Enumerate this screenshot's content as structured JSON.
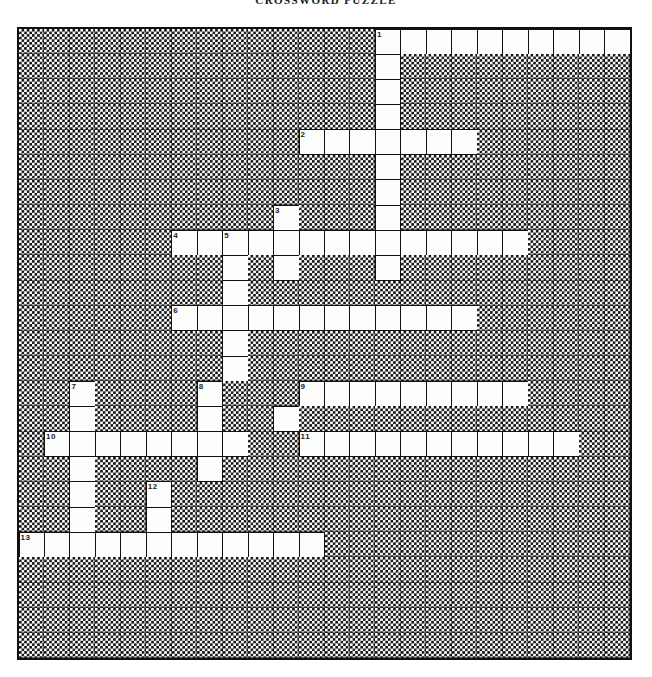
{
  "title": "CROSSWORD PUZZLE",
  "grid": {
    "columns": 24,
    "rows": 25,
    "cell_colors": {
      "open": "#fdfdfb",
      "block_fill": "#111111",
      "block_background": "#ffffff",
      "grid_line": "#111111"
    },
    "legend": {
      "open_symbol": ".",
      "block_symbol": "#"
    },
    "layout": [
      "###############..........",
      "###############.########",
      "###############.########",
      "###############.########",
      "############......######",
      "###############.########",
      "###############.########",
      "###########.###.########",
      "#######...............##",
      "########.##.###.########",
      "########.###############",
      "#######...........######",
      "########.###############",
      "########.###############",
      "###.####.###.........###",
      "###.####.##.#.##########",
      "#.........#.#...........",
      "###.####.###.###########",
      "###.##.#.###############",
      "###.##.#################",
      "............############",
      "########################",
      "########################",
      "########################",
      "########################"
    ],
    "rows_data": [
      {
        "row": 0,
        "open_runs": [
          {
            "start": 14,
            "len": 10
          }
        ]
      },
      {
        "row": 1,
        "open_runs": [
          {
            "start": 14,
            "len": 1
          }
        ]
      },
      {
        "row": 2,
        "open_runs": [
          {
            "start": 14,
            "len": 1
          }
        ]
      },
      {
        "row": 3,
        "open_runs": [
          {
            "start": 14,
            "len": 1
          }
        ]
      },
      {
        "row": 4,
        "open_runs": [
          {
            "start": 11,
            "len": 7
          }
        ]
      },
      {
        "row": 5,
        "open_runs": [
          {
            "start": 14,
            "len": 1
          }
        ]
      },
      {
        "row": 6,
        "open_runs": [
          {
            "start": 14,
            "len": 1
          }
        ]
      },
      {
        "row": 7,
        "open_runs": [
          {
            "start": 10,
            "len": 1
          },
          {
            "start": 14,
            "len": 1
          }
        ]
      },
      {
        "row": 8,
        "open_runs": [
          {
            "start": 6,
            "len": 14
          }
        ]
      },
      {
        "row": 9,
        "open_runs": [
          {
            "start": 8,
            "len": 1
          },
          {
            "start": 10,
            "len": 1
          },
          {
            "start": 14,
            "len": 1
          }
        ]
      },
      {
        "row": 10,
        "open_runs": [
          {
            "start": 8,
            "len": 1
          }
        ]
      },
      {
        "row": 11,
        "open_runs": [
          {
            "start": 6,
            "len": 12
          }
        ]
      },
      {
        "row": 12,
        "open_runs": [
          {
            "start": 8,
            "len": 1
          }
        ]
      },
      {
        "row": 13,
        "open_runs": [
          {
            "start": 8,
            "len": 1
          }
        ]
      },
      {
        "row": 14,
        "open_runs": [
          {
            "start": 2,
            "len": 1
          },
          {
            "start": 7,
            "len": 1
          },
          {
            "start": 11,
            "len": 9
          }
        ]
      },
      {
        "row": 15,
        "open_runs": [
          {
            "start": 2,
            "len": 1
          },
          {
            "start": 7,
            "len": 1
          },
          {
            "start": 10,
            "len": 1
          }
        ]
      },
      {
        "row": 16,
        "open_runs": [
          {
            "start": 1,
            "len": 8
          },
          {
            "start": 11,
            "len": 11
          }
        ]
      },
      {
        "row": 17,
        "open_runs": [
          {
            "start": 2,
            "len": 1
          },
          {
            "start": 7,
            "len": 1
          }
        ]
      },
      {
        "row": 18,
        "open_runs": [
          {
            "start": 2,
            "len": 1
          },
          {
            "start": 5,
            "len": 1
          }
        ]
      },
      {
        "row": 19,
        "open_runs": [
          {
            "start": 2,
            "len": 1
          },
          {
            "start": 5,
            "len": 1
          }
        ]
      },
      {
        "row": 20,
        "open_runs": [
          {
            "start": 0,
            "len": 12
          }
        ]
      },
      {
        "row": 21,
        "open_runs": []
      },
      {
        "row": 22,
        "open_runs": []
      },
      {
        "row": 23,
        "open_runs": []
      },
      {
        "row": 24,
        "open_runs": []
      }
    ],
    "clue_numbers": [
      {
        "label": "1",
        "row": 0,
        "col": 14
      },
      {
        "label": "2",
        "row": 4,
        "col": 11
      },
      {
        "label": "3",
        "row": 7,
        "col": 10
      },
      {
        "label": "4",
        "row": 8,
        "col": 6
      },
      {
        "label": "5",
        "row": 8,
        "col": 8
      },
      {
        "label": "6",
        "row": 11,
        "col": 6
      },
      {
        "label": "7",
        "row": 14,
        "col": 2
      },
      {
        "label": "8",
        "row": 14,
        "col": 7
      },
      {
        "label": "9",
        "row": 14,
        "col": 11
      },
      {
        "label": "10",
        "row": 16,
        "col": 1
      },
      {
        "label": "11",
        "row": 16,
        "col": 11
      },
      {
        "label": "12",
        "row": 18,
        "col": 5
      },
      {
        "label": "13",
        "row": 20,
        "col": 0
      }
    ]
  }
}
